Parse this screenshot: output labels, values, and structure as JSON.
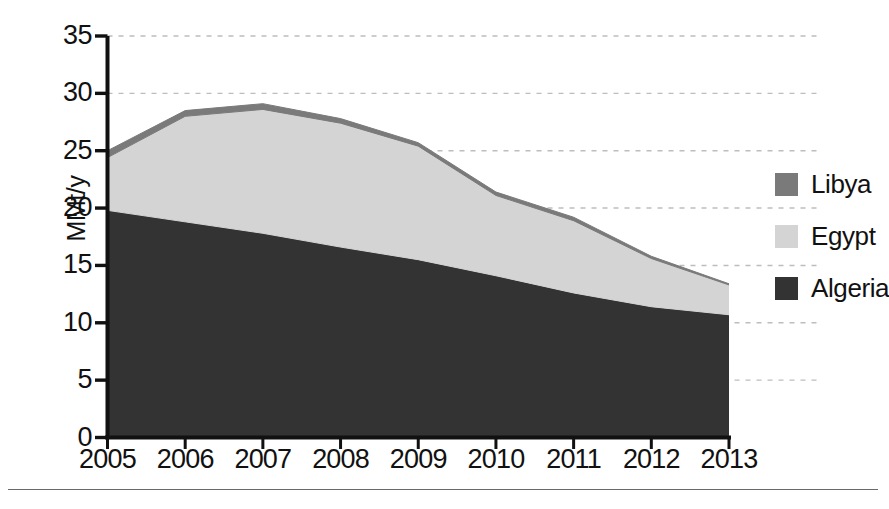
{
  "chart_data": {
    "type": "area",
    "stacked": true,
    "title": "",
    "subtitle": "",
    "xlabel": "",
    "ylabel": "MMt/y",
    "categories": [
      "2005",
      "2006",
      "2007",
      "2008",
      "2009",
      "2010",
      "2011",
      "2012",
      "2013"
    ],
    "x": [
      2005,
      2006,
      2007,
      2008,
      2009,
      2010,
      2011,
      2012,
      2013
    ],
    "xlim": [
      2005,
      2013
    ],
    "ylim": [
      0,
      35
    ],
    "yticks": [
      0,
      5,
      10,
      15,
      20,
      25,
      30,
      35
    ],
    "ytick_labels": [
      "0",
      "5",
      "10",
      "15",
      "20",
      "25",
      "30",
      "35"
    ],
    "grid": "horizontal-dashed",
    "legend_position": "right",
    "stack_order_bottom_to_top": [
      "Algeria",
      "Egypt",
      "Libya"
    ],
    "series": [
      {
        "name": "Algeria",
        "color": "#333333",
        "values": [
          19.8,
          18.8,
          17.8,
          16.6,
          15.5,
          14.1,
          12.6,
          11.4,
          10.7
        ]
      },
      {
        "name": "Egypt",
        "color": "#d4d4d4",
        "values": [
          4.6,
          9.2,
          10.8,
          10.8,
          9.9,
          7.0,
          6.3,
          4.2,
          2.6
        ]
      },
      {
        "name": "Libya",
        "color": "#7a7a7a",
        "values": [
          0.6,
          0.5,
          0.5,
          0.4,
          0.3,
          0.3,
          0.3,
          0.2,
          0.1
        ]
      }
    ],
    "cumulative_totals": [
      25.0,
      28.5,
      29.1,
      27.8,
      25.7,
      21.4,
      19.2,
      15.8,
      13.4
    ]
  },
  "axis": {
    "y_title": "MMt/y",
    "y_tick_labels": [
      "35",
      "30",
      "25",
      "20",
      "15",
      "10",
      "5",
      "0"
    ],
    "x_tick_labels": [
      "2005",
      "2006",
      "2007",
      "2008",
      "2009",
      "2010",
      "2011",
      "2012",
      "2013"
    ]
  },
  "legend": {
    "items": [
      {
        "label": "Libya",
        "color": "#7a7a7a"
      },
      {
        "label": "Egypt",
        "color": "#d4d4d4"
      },
      {
        "label": "Algeria",
        "color": "#333333"
      }
    ]
  },
  "colors": {
    "algeria": "#333333",
    "egypt": "#d4d4d4",
    "libya": "#7a7a7a",
    "axis": "#111111",
    "gridline": "#bdbdbd",
    "rule": "#6a6a6a",
    "background": "#ffffff"
  }
}
